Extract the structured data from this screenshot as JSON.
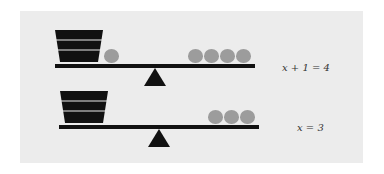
{
  "colors": {
    "panel": "#ececec",
    "beam": "#111111",
    "apple": "#9c9c9c"
  },
  "scales": [
    {
      "left_pan": {
        "bucket": "x",
        "apples": 1
      },
      "right_pan": {
        "apples": 4
      },
      "equation": "x + 1 = 4"
    },
    {
      "left_pan": {
        "bucket": "x",
        "apples": 0
      },
      "right_pan": {
        "apples": 3
      },
      "equation": "x = 3"
    }
  ]
}
